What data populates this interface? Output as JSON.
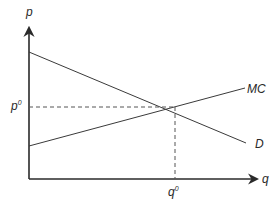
{
  "diagram": {
    "type": "supply-demand",
    "axes": {
      "y_label": "p",
      "x_label": "q"
    },
    "curves": [
      {
        "name": "MC",
        "label": "MC",
        "from": [
          29,
          146
        ],
        "to": [
          245,
          88
        ]
      },
      {
        "name": "D",
        "label": "D",
        "from": [
          29,
          52
        ],
        "to": [
          246,
          143
        ]
      }
    ],
    "equilibrium": {
      "point": [
        175,
        107
      ],
      "price_label": "p",
      "price_superscript": "0",
      "quantity_label": "q",
      "quantity_superscript": "0"
    },
    "colors": {
      "line": "#3a3a3a",
      "axis": "#2a2a2a",
      "dashed": "#555555",
      "background": "#ffffff"
    }
  }
}
